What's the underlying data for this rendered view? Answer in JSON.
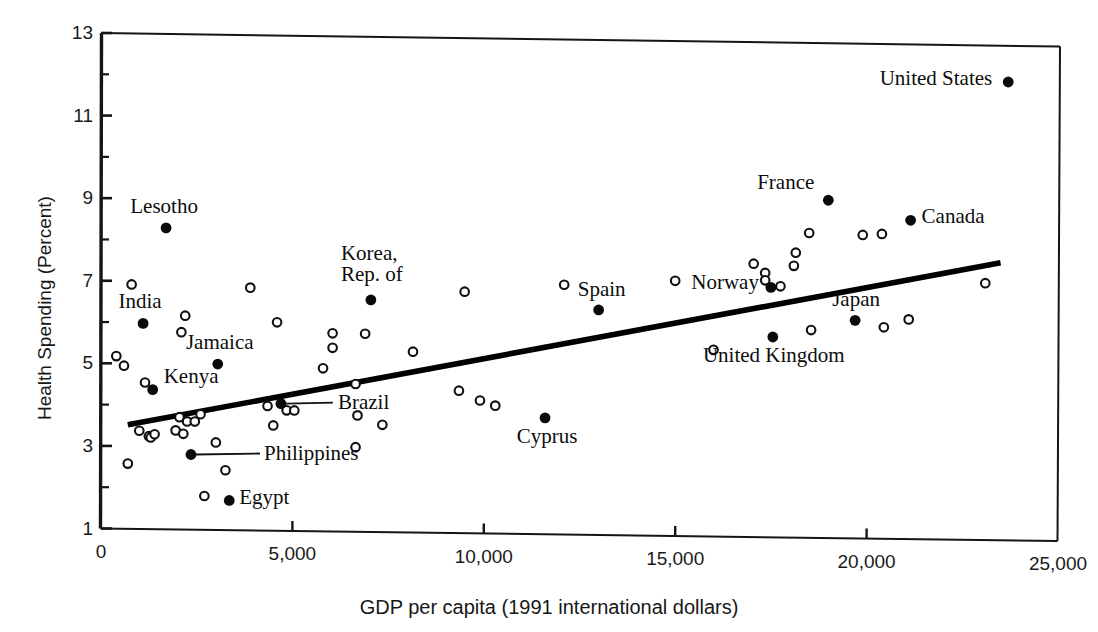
{
  "chart_data": {
    "type": "scatter",
    "title": "",
    "xlabel": "GDP per capita (1991 international dollars)",
    "ylabel": "Health Spending (Percent)",
    "xlim": [
      0,
      25000
    ],
    "ylim": [
      1,
      13
    ],
    "xticks": [
      0,
      5000,
      10000,
      15000,
      20000,
      25000
    ],
    "xtick_labels": [
      "0",
      "5,000",
      "10,000",
      "15,000",
      "20,000",
      "25,000"
    ],
    "yticks": [
      1,
      3,
      5,
      7,
      9,
      11,
      13
    ],
    "ytick_labels": [
      "1",
      "3",
      "5",
      "7",
      "9",
      "11",
      "13"
    ],
    "y_minor_ticks": [
      2,
      4,
      6,
      8,
      10,
      12
    ],
    "grid": false,
    "legend": "none",
    "marker_filled_meaning": "labeled country",
    "marker_open_meaning": "unlabeled country",
    "trendline": {
      "x_start": 700,
      "y_start": 3.52,
      "x_end": 23500,
      "y_end": 7.72,
      "style": "solid-thick"
    },
    "labeled_points": [
      {
        "name": "United States",
        "x": 23700,
        "y": 12.1,
        "label_pos": "left"
      },
      {
        "name": "France",
        "x": 19000,
        "y": 9.18,
        "label_pos": "left"
      },
      {
        "name": "Canada",
        "x": 21150,
        "y": 8.72,
        "label_pos": "right"
      },
      {
        "name": "Lesotho",
        "x": 1700,
        "y": 8.3,
        "label_pos": "above"
      },
      {
        "name": "Korea, Rep. of",
        "x": 7050,
        "y": 6.62,
        "label_pos": "above"
      },
      {
        "name": "Spain",
        "x": 13000,
        "y": 6.45,
        "label_pos": "above"
      },
      {
        "name": "Norway",
        "x": 17500,
        "y": 7.05,
        "label_pos": "left"
      },
      {
        "name": "Japan",
        "x": 19700,
        "y": 6.28,
        "label_pos": "above"
      },
      {
        "name": "United Kingdom",
        "x": 17550,
        "y": 5.85,
        "label_pos": "below"
      },
      {
        "name": "India",
        "x": 1100,
        "y": 5.98,
        "label_pos": "above"
      },
      {
        "name": "Jamaica",
        "x": 3050,
        "y": 5.02,
        "label_pos": "above"
      },
      {
        "name": "Kenya",
        "x": 1350,
        "y": 4.38,
        "label_pos": "right"
      },
      {
        "name": "Brazil",
        "x": 4700,
        "y": 4.08,
        "label_pos": "leader"
      },
      {
        "name": "Cyprus",
        "x": 11600,
        "y": 3.82,
        "label_pos": "below"
      },
      {
        "name": "Philippines",
        "x": 2350,
        "y": 2.82,
        "label_pos": "leader"
      },
      {
        "name": "Egypt",
        "x": 3350,
        "y": 1.72,
        "label_pos": "right"
      }
    ],
    "unlabeled_points": [
      {
        "x": 800,
        "y": 6.92
      },
      {
        "x": 2200,
        "y": 6.18
      },
      {
        "x": 2100,
        "y": 5.78
      },
      {
        "x": 3900,
        "y": 6.88
      },
      {
        "x": 4600,
        "y": 6.05
      },
      {
        "x": 6050,
        "y": 5.8
      },
      {
        "x": 6050,
        "y": 5.45
      },
      {
        "x": 6900,
        "y": 5.8
      },
      {
        "x": 9500,
        "y": 6.85
      },
      {
        "x": 12100,
        "y": 7.05
      },
      {
        "x": 15000,
        "y": 7.18
      },
      {
        "x": 17350,
        "y": 7.4
      },
      {
        "x": 17350,
        "y": 7.22
      },
      {
        "x": 17750,
        "y": 7.08
      },
      {
        "x": 17050,
        "y": 7.62
      },
      {
        "x": 18100,
        "y": 7.58
      },
      {
        "x": 18150,
        "y": 7.9
      },
      {
        "x": 18500,
        "y": 8.38
      },
      {
        "x": 19900,
        "y": 8.35
      },
      {
        "x": 20400,
        "y": 8.38
      },
      {
        "x": 23100,
        "y": 7.22
      },
      {
        "x": 21100,
        "y": 6.32
      },
      {
        "x": 18550,
        "y": 6.03
      },
      {
        "x": 20450,
        "y": 6.12
      },
      {
        "x": 16000,
        "y": 5.52
      },
      {
        "x": 8150,
        "y": 5.38
      },
      {
        "x": 5800,
        "y": 4.95
      },
      {
        "x": 400,
        "y": 5.18
      },
      {
        "x": 600,
        "y": 4.95
      },
      {
        "x": 1150,
        "y": 4.55
      },
      {
        "x": 6650,
        "y": 4.58
      },
      {
        "x": 9350,
        "y": 4.45
      },
      {
        "x": 9900,
        "y": 4.22
      },
      {
        "x": 10300,
        "y": 4.1
      },
      {
        "x": 4350,
        "y": 4.02
      },
      {
        "x": 4850,
        "y": 3.92
      },
      {
        "x": 5050,
        "y": 3.92
      },
      {
        "x": 6700,
        "y": 3.82
      },
      {
        "x": 7350,
        "y": 3.6
      },
      {
        "x": 2050,
        "y": 3.72
      },
      {
        "x": 2600,
        "y": 3.8
      },
      {
        "x": 2250,
        "y": 3.62
      },
      {
        "x": 2450,
        "y": 3.62
      },
      {
        "x": 4500,
        "y": 3.55
      },
      {
        "x": 1000,
        "y": 3.38
      },
      {
        "x": 1250,
        "y": 3.25
      },
      {
        "x": 1300,
        "y": 3.22
      },
      {
        "x": 1400,
        "y": 3.3
      },
      {
        "x": 1950,
        "y": 3.4
      },
      {
        "x": 2150,
        "y": 3.32
      },
      {
        "x": 3000,
        "y": 3.12
      },
      {
        "x": 6650,
        "y": 3.05
      },
      {
        "x": 700,
        "y": 2.58
      },
      {
        "x": 3250,
        "y": 2.45
      },
      {
        "x": 2700,
        "y": 1.82
      }
    ]
  },
  "axes": {
    "x_title": "GDP per capita (1991 international dollars)",
    "y_title": "Health Spending (Percent)"
  },
  "labels": {
    "united_states": "United States",
    "france": "France",
    "canada": "Canada",
    "lesotho": "Lesotho",
    "korea_line1": "Korea,",
    "korea_line2": "Rep. of",
    "spain": "Spain",
    "norway": "Norway",
    "japan": "Japan",
    "united_kingdom": "United Kingdom",
    "india": "India",
    "jamaica": "Jamaica",
    "kenya": "Kenya",
    "brazil": "Brazil",
    "cyprus": "Cyprus",
    "philippines": "Philippines",
    "egypt": "Egypt"
  },
  "colors": {
    "ink": "#111111",
    "background": "#ffffff",
    "trendline": "#000000"
  }
}
